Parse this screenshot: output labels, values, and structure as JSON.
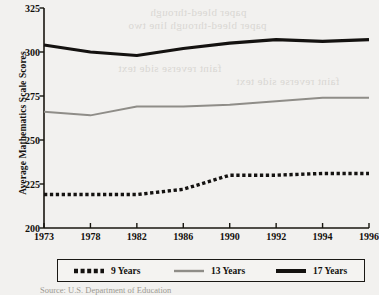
{
  "chart_data": {
    "type": "line",
    "title": "",
    "subtitle": "",
    "xlabel": "",
    "ylabel": "Average Mathematics Scale Scores",
    "categories": [
      "1973",
      "1978",
      "1982",
      "1986",
      "1990",
      "1992",
      "1994",
      "1996"
    ],
    "x": [
      "1973",
      "1978",
      "1982",
      "1986",
      "1990",
      "1992",
      "1994",
      "1996"
    ],
    "ylim": [
      200,
      325
    ],
    "yticks": [
      200,
      225,
      250,
      275,
      300,
      325
    ],
    "ytick_labels": [
      "200",
      "225",
      "250",
      "275",
      "300",
      "325"
    ],
    "grid": false,
    "legend_position": "bottom",
    "series": [
      {
        "name": "9 Years",
        "style": "dotted",
        "color": "#141210",
        "values": [
          219,
          219,
          219,
          222,
          230,
          230,
          231,
          231
        ]
      },
      {
        "name": "13 Years",
        "style": "solid",
        "color": "#8f8d88",
        "values": [
          266,
          264,
          269,
          269,
          270,
          272,
          274,
          274
        ]
      },
      {
        "name": "17 Years",
        "style": "solid-thick",
        "color": "#141210",
        "values": [
          304,
          300,
          298,
          302,
          305,
          307,
          306,
          307
        ]
      }
    ]
  },
  "legend": {
    "items": [
      {
        "label": "9 Years",
        "icon": "dotted-line-swatch"
      },
      {
        "label": "13 Years",
        "icon": "gray-line-swatch"
      },
      {
        "label": "17 Years",
        "icon": "black-line-swatch"
      }
    ]
  },
  "footer": {
    "source": "Source: U.S. Department of Education"
  },
  "ghost_text": [
    {
      "text": "paper bleed-through",
      "x": 150,
      "y": 6
    },
    {
      "text": "paper bleed-through line two",
      "x": 128,
      "y": 19
    },
    {
      "text": "faint reverse side text",
      "x": 118,
      "y": 62
    },
    {
      "text": "faint reverse side text",
      "x": 236,
      "y": 75
    }
  ],
  "colors": {
    "background": "#f2f1ef",
    "axis": "#18160f",
    "series_9": "#141210",
    "series_13": "#8f8d88",
    "series_17": "#141210"
  }
}
